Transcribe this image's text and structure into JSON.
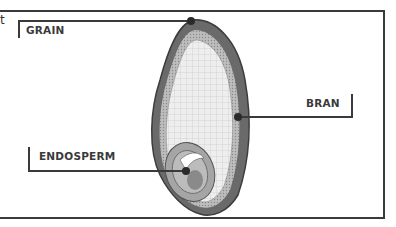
{
  "diagram": {
    "partial_text_left": "t",
    "labels": {
      "grain": "GRAIN",
      "bran": "BRAN",
      "endosperm": "ENDOSPERM"
    },
    "colors": {
      "frame": "#3a3a3a",
      "bran_outer": "#5a5a5a",
      "endosperm_fill": "#e8e8e8",
      "germ": "#9a9a9a",
      "label_text": "#3a3a3a"
    }
  }
}
